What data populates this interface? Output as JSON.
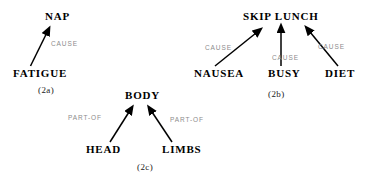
{
  "figure": {
    "background_color": "#ffffff",
    "node_color": "#000000",
    "edge_label_color": "#8c8c8c",
    "arrow_color": "#000000",
    "panels": [
      {
        "id": "2a",
        "caption": "(2a)",
        "nodes": [
          {
            "name": "nap",
            "label": "NAP"
          },
          {
            "name": "fatigue",
            "label": "FATIGUE"
          }
        ],
        "edges": [
          {
            "from": "FATIGUE",
            "to": "NAP",
            "label": "CAUSE"
          }
        ]
      },
      {
        "id": "2b",
        "caption": "(2b)",
        "nodes": [
          {
            "name": "skip-lunch",
            "label": "SKIP LUNCH"
          },
          {
            "name": "nausea",
            "label": "NAUSEA"
          },
          {
            "name": "busy",
            "label": "BUSY"
          },
          {
            "name": "diet",
            "label": "DIET"
          }
        ],
        "edges": [
          {
            "from": "NAUSEA",
            "to": "SKIP LUNCH",
            "label": "CAUSE"
          },
          {
            "from": "BUSY",
            "to": "SKIP LUNCH",
            "label": "CAUSE"
          },
          {
            "from": "DIET",
            "to": "SKIP LUNCH",
            "label": "CAUSE"
          }
        ]
      },
      {
        "id": "2c",
        "caption": "(2c)",
        "nodes": [
          {
            "name": "body",
            "label": "BODY"
          },
          {
            "name": "head",
            "label": "HEAD"
          },
          {
            "name": "limbs",
            "label": "LIMBS"
          }
        ],
        "edges": [
          {
            "from": "HEAD",
            "to": "BODY",
            "label": "PART-OF"
          },
          {
            "from": "LIMBS",
            "to": "BODY",
            "label": "PART-OF"
          }
        ]
      }
    ]
  }
}
